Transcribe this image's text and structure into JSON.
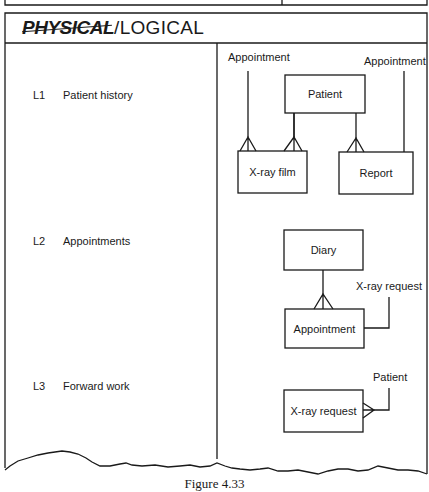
{
  "header": {
    "struck_word": "PHYSICAL",
    "separator": "/",
    "title_word": "LOGICAL"
  },
  "levels": [
    {
      "code": "L1",
      "name": "Patient history"
    },
    {
      "code": "L2",
      "name": "Appointments"
    },
    {
      "code": "L3",
      "name": "Forward work"
    }
  ],
  "l1_diagram": {
    "entities": {
      "patient": "Patient",
      "xray_film": "X-ray film",
      "report": "Report"
    },
    "external_labels": {
      "left": "Appointment",
      "right": "Appointment"
    }
  },
  "l2_diagram": {
    "entities": {
      "diary": "Diary",
      "appointment": "Appointment"
    },
    "external_labels": {
      "xray_request": "X-ray request"
    }
  },
  "l3_diagram": {
    "entities": {
      "xray_request": "X-ray request"
    },
    "external_labels": {
      "patient": "Patient"
    }
  },
  "caption": "Figure 4.33",
  "colors": {
    "ink": "#1a1a1a",
    "paper": "#ffffff"
  }
}
